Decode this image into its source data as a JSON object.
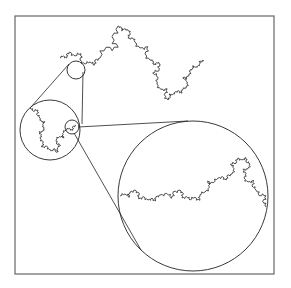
{
  "diagram": {
    "type": "fractal-magnification",
    "colors": {
      "background": "#ffffff",
      "frame": "#666666",
      "stroke": "#222222"
    },
    "frame": {
      "x": 15,
      "y": 16,
      "width": 259,
      "height": 258
    },
    "circles": [
      {
        "name": "zoom-source-small",
        "cx": 76,
        "cy": 70,
        "r": 9
      },
      {
        "name": "zoom-level-1",
        "cx": 50,
        "cy": 130,
        "r": 30
      },
      {
        "name": "zoom-source-inner",
        "cx": 72,
        "cy": 127,
        "r": 7
      },
      {
        "name": "zoom-level-2",
        "cx": 193,
        "cy": 196,
        "r": 75
      }
    ],
    "connectors": [
      {
        "x1": 69,
        "y1": 64,
        "x2": 31,
        "y2": 107
      },
      {
        "x1": 83,
        "y1": 72,
        "x2": 82,
        "y2": 124
      },
      {
        "x1": 78,
        "y1": 127,
        "x2": 188,
        "y2": 121
      },
      {
        "x1": 74,
        "y1": 133,
        "x2": 141,
        "y2": 250
      }
    ]
  }
}
